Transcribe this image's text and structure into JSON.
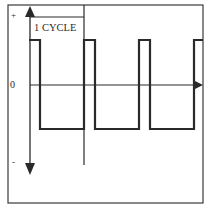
{
  "diagram": {
    "axis_labels": {
      "positive": "+",
      "zero": "0",
      "negative": "-"
    },
    "cycle_label": "1 CYCLE",
    "colors": {
      "background": "#ffffff",
      "line": "#2a2a2a",
      "frame": "#3a3a3a"
    },
    "waveform": {
      "type": "square",
      "high_level": "+",
      "low_level": "-",
      "cycles_shown": 3.2
    }
  }
}
